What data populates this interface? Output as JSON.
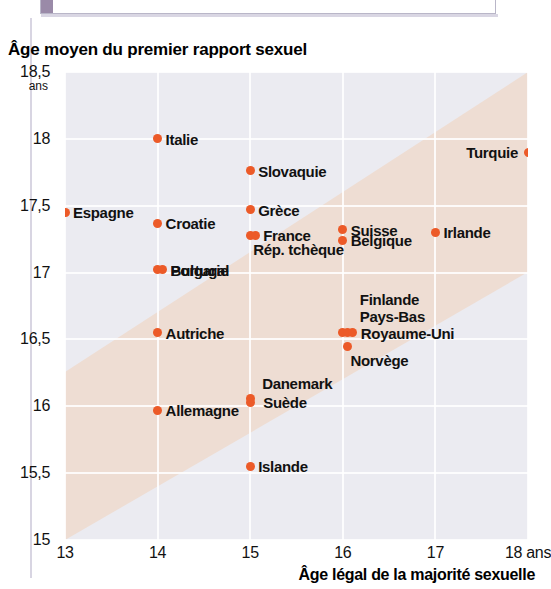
{
  "banner": {
    "text": "15-16 ANS : L'ÂGE DU PREMIER RAPPORT SEXUEL EN EUROPE"
  },
  "chart_title": "Âge moyen du premier rapport sexuel",
  "y_unit": "ans",
  "x_unit_suffix": "ans",
  "colors": {
    "dot": "#ec5a28",
    "plot_background": "#ebebf1",
    "band": "#eeddd3",
    "grid": "#ffffff"
  },
  "chart_data": {
    "type": "scatter",
    "title": "Âge moyen du premier rapport sexuel",
    "xlabel": "Âge légal de la majorité sexuelle",
    "ylabel": "Âge moyen du premier rapport sexuel",
    "xlim": [
      13,
      18
    ],
    "ylim": [
      15,
      18.5
    ],
    "xticks": [
      "13",
      "14",
      "15",
      "16",
      "17",
      "18 ans"
    ],
    "xtick_values": [
      13,
      14,
      15,
      16,
      17,
      18
    ],
    "yticks": [
      "18,5",
      "18",
      "17,5",
      "17",
      "16,5",
      "16",
      "15,5",
      "15"
    ],
    "ytick_values": [
      18.5,
      18,
      17.5,
      17,
      16.5,
      16,
      15.5,
      15
    ],
    "grid": true,
    "legend": false,
    "annotation": "Une bande diagonale claire traverse le graphique du bas-gauche vers le haut-droite",
    "points": [
      {
        "label": "Espagne",
        "x": 13,
        "y": 17.45,
        "side": "right",
        "cluster": 1
      },
      {
        "label": "Italie",
        "x": 14,
        "y": 18.0,
        "side": "right",
        "cluster": 1
      },
      {
        "label": "Croatie",
        "x": 14,
        "y": 17.37,
        "side": "right",
        "cluster": 1
      },
      {
        "label": "Portugal",
        "x": 14,
        "y": 17.02,
        "side": "right",
        "cluster": 2
      },
      {
        "label": "Bulgarie",
        "x": 14,
        "y": 17.02,
        "side": "right",
        "cluster": 2
      },
      {
        "label": "Autriche",
        "x": 14,
        "y": 16.55,
        "side": "right",
        "cluster": 1
      },
      {
        "label": "Allemagne",
        "x": 14,
        "y": 15.97,
        "side": "right",
        "cluster": 1
      },
      {
        "label": "Slovaquie",
        "x": 15,
        "y": 17.76,
        "side": "right",
        "cluster": 1
      },
      {
        "label": "Grèce",
        "x": 15,
        "y": 17.47,
        "side": "right",
        "cluster": 1
      },
      {
        "label": "France",
        "x": 15,
        "y": 17.28,
        "side": "right",
        "cluster": 2
      },
      {
        "label": "Rép. tchèque",
        "x": 15,
        "y": 17.28,
        "side": "below",
        "cluster": 2
      },
      {
        "label": "Danemark",
        "x": 15,
        "y": 16.06,
        "side": "above",
        "cluster": 2
      },
      {
        "label": "Suède",
        "x": 15,
        "y": 16.03,
        "side": "right",
        "cluster": 2
      },
      {
        "label": "Islande",
        "x": 15,
        "y": 15.55,
        "side": "right",
        "cluster": 1
      },
      {
        "label": "Suisse",
        "x": 16,
        "y": 17.32,
        "side": "right",
        "cluster": 1
      },
      {
        "label": "Belgique",
        "x": 16,
        "y": 17.24,
        "side": "right",
        "cluster": 1
      },
      {
        "label": "Finlande",
        "x": 16,
        "y": 16.55,
        "side": "above2",
        "cluster": 3
      },
      {
        "label": "Pays-Bas",
        "x": 16,
        "y": 16.55,
        "side": "above1",
        "cluster": 3
      },
      {
        "label": "Royaume-Uni",
        "x": 16,
        "y": 16.55,
        "side": "right",
        "cluster": 3
      },
      {
        "label": "Norvège",
        "x": 16.05,
        "y": 16.45,
        "side": "below",
        "cluster": 1
      },
      {
        "label": "Irlande",
        "x": 17,
        "y": 17.3,
        "side": "right",
        "cluster": 1
      },
      {
        "label": "Turquie",
        "x": 18,
        "y": 17.9,
        "side": "left",
        "cluster": 1
      }
    ]
  }
}
